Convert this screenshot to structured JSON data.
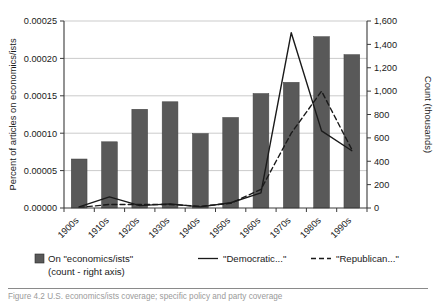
{
  "chart_data": {
    "type": "bar",
    "title": "",
    "categories": [
      "1900s",
      "1910s",
      "1920s",
      "1930s",
      "1940s",
      "1950s",
      "1960s",
      "1970s",
      "1980s",
      "1990s"
    ],
    "xlabel": "",
    "ylabel": "Percent of articles on economics/ists",
    "ylabel_right": "Count (thousands)",
    "ylim": [
      0,
      0.00025
    ],
    "yticks": [
      "0.00000",
      "0.00005",
      "0.00010",
      "0.00015",
      "0.00020",
      "0.00025"
    ],
    "ytick_values": [
      0,
      5e-05,
      0.0001,
      0.00015,
      0.0002,
      0.00025
    ],
    "ylim_right": [
      0,
      1600
    ],
    "yticks_right": [
      "0",
      "200",
      "400",
      "600",
      "800",
      "1,000",
      "1,200",
      "1,400",
      "1,600"
    ],
    "ytick_values_right": [
      0,
      200,
      400,
      600,
      800,
      1000,
      1200,
      1400,
      1600
    ],
    "grid": true,
    "legend_position": "bottom",
    "series": [
      {
        "name": "On \"economics/ists\" (count - right axis)",
        "legend_label_line1": "On \"economics/ists\"",
        "legend_label_line2": "(count - right axis)",
        "type": "bar",
        "axis": "left",
        "color": "#595959",
        "values": [
          6.55e-05,
          8.85e-05,
          0.000132,
          0.000142,
          9.95e-05,
          0.000121,
          0.000153,
          0.000168,
          0.000229,
          0.000205
        ]
      },
      {
        "name": "\"Democratic...\"",
        "legend_label": "\"Democratic...\"",
        "type": "line",
        "style": "solid",
        "axis": "right",
        "color": "#1a1a1a",
        "values": [
          10,
          95,
          20,
          35,
          10,
          45,
          130,
          1500,
          660,
          490
        ]
      },
      {
        "name": "\"Republican...\"",
        "legend_label": "\"Republican...\"",
        "type": "line",
        "style": "dashed",
        "axis": "right",
        "color": "#1a1a1a",
        "values": [
          5,
          30,
          30,
          30,
          15,
          40,
          160,
          640,
          1000,
          500
        ]
      }
    ]
  },
  "caption": {
    "text": "Figure 4.2  U.S. economics/ists coverage; specific policy and party coverage"
  }
}
